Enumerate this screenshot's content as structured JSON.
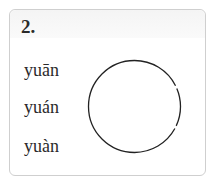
{
  "question": {
    "number": "2.",
    "options": [
      {
        "label": "yuān"
      },
      {
        "label": "yuán"
      },
      {
        "label": "yuàn"
      }
    ],
    "answer_circle": {
      "cx": 134.5,
      "cy": 106.5,
      "r": 46,
      "stroke": "#222222"
    }
  }
}
